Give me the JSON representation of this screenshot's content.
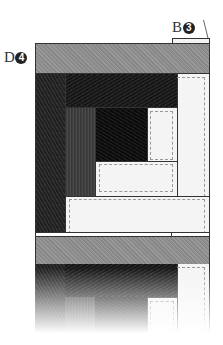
{
  "labels": {
    "b3": {
      "letter": "B",
      "number": "3"
    },
    "d4": {
      "letter": "D",
      "number": "4"
    }
  },
  "colors": {
    "outline": "#333333",
    "grey_strip": "#909090",
    "dark_fabric": "#262626",
    "black_fabric": "#111111",
    "light_fabric": "#f4f4f4",
    "seam_dash": "#999999"
  },
  "block_pieces": [
    "top grey strip D4",
    "left dark column",
    "top dark band",
    "medium dark strip",
    "black center",
    "light square",
    "light rectangle",
    "right light column",
    "bottom light strip",
    "B3 tab"
  ]
}
